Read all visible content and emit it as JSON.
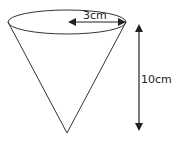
{
  "diagram": {
    "shape": "cone",
    "orientation": "apex-down",
    "radius_label": "3cm",
    "height_label": "10cm",
    "colors": {
      "stroke": "#333333",
      "background": "#ffffff"
    }
  }
}
